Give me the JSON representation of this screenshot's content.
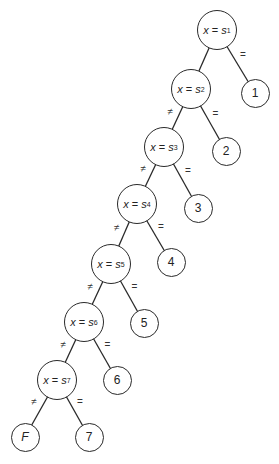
{
  "diagram": {
    "type": "decision-tree",
    "line_color": "#2a2a2a",
    "test_nodes": [
      {
        "id": "s1",
        "var": "x",
        "op": "=",
        "sym": "s",
        "sub": "1",
        "cx": 217,
        "cy": 30
      },
      {
        "id": "s2",
        "var": "x",
        "op": "=",
        "sym": "s",
        "sub": "2",
        "cx": 191,
        "cy": 89
      },
      {
        "id": "s3",
        "var": "x",
        "op": "=",
        "sym": "s",
        "sub": "3",
        "cx": 164,
        "cy": 147
      },
      {
        "id": "s4",
        "var": "x",
        "op": "=",
        "sym": "s",
        "sub": "4",
        "cx": 137,
        "cy": 204
      },
      {
        "id": "s5",
        "var": "x",
        "op": "=",
        "sym": "s",
        "sub": "5",
        "cx": 111,
        "cy": 264
      },
      {
        "id": "s6",
        "var": "x",
        "op": "=",
        "sym": "s",
        "sub": "6",
        "cx": 84,
        "cy": 322
      },
      {
        "id": "s7",
        "var": "x",
        "op": "=",
        "sym": "s",
        "sub": "7",
        "cx": 57,
        "cy": 380
      }
    ],
    "leaf_nodes": [
      {
        "id": "l1",
        "label": "1",
        "cx": 255,
        "cy": 93
      },
      {
        "id": "l2",
        "label": "2",
        "cx": 226,
        "cy": 151
      },
      {
        "id": "l3",
        "label": "3",
        "cx": 198,
        "cy": 208
      },
      {
        "id": "l4",
        "label": "4",
        "cx": 171,
        "cy": 262
      },
      {
        "id": "l5",
        "label": "5",
        "cx": 144,
        "cy": 323
      },
      {
        "id": "l6",
        "label": "6",
        "cx": 117,
        "cy": 380
      },
      {
        "id": "l7",
        "label": "7",
        "cx": 89,
        "cy": 437
      },
      {
        "id": "lF",
        "label": "F",
        "cx": 25,
        "cy": 437
      }
    ],
    "edges": [
      {
        "from": "s1",
        "to": "s2",
        "label": ""
      },
      {
        "from": "s1",
        "to": "l1",
        "label": "="
      },
      {
        "from": "s2",
        "to": "s3",
        "label": "≠"
      },
      {
        "from": "s2",
        "to": "l2",
        "label": "="
      },
      {
        "from": "s3",
        "to": "s4",
        "label": "≠"
      },
      {
        "from": "s3",
        "to": "l3",
        "label": "="
      },
      {
        "from": "s4",
        "to": "s5",
        "label": "≠"
      },
      {
        "from": "s4",
        "to": "l4",
        "label": "="
      },
      {
        "from": "s5",
        "to": "s6",
        "label": "≠"
      },
      {
        "from": "s5",
        "to": "l5",
        "label": "="
      },
      {
        "from": "s6",
        "to": "s7",
        "label": "≠"
      },
      {
        "from": "s6",
        "to": "l6",
        "label": "="
      },
      {
        "from": "s7",
        "to": "lF",
        "label": "≠"
      },
      {
        "from": "s7",
        "to": "l7",
        "label": "="
      }
    ]
  }
}
